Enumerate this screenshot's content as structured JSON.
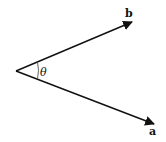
{
  "diagram": {
    "vectors": [
      {
        "name": "b",
        "label": "b",
        "from": [
          16,
          71
        ],
        "to": [
          132,
          22
        ]
      },
      {
        "name": "a",
        "label": "a",
        "from": [
          16,
          71
        ],
        "to": [
          154,
          124
        ]
      }
    ],
    "angle": {
      "label": "θ"
    },
    "colors": {
      "stroke": "#111111",
      "background": "#ffffff"
    }
  }
}
